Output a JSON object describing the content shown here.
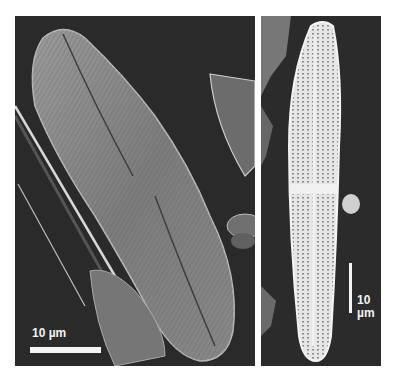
{
  "figure": {
    "left_panel": {
      "subject": "sem-diatom-valve-large",
      "scale_bar": {
        "label": "10 µm",
        "orientation": "horizontal"
      }
    },
    "right_panel": {
      "subject": "sem-diatom-valve-lanceolate",
      "scale_bar": {
        "label_line1": "10",
        "label_line2": "µm",
        "orientation": "vertical"
      }
    },
    "colors": {
      "background": "#ffffff",
      "panel_bg": "#2a2a2a",
      "specimen": "#8c8c8c",
      "scale_bar": "#f4f4f4"
    }
  }
}
